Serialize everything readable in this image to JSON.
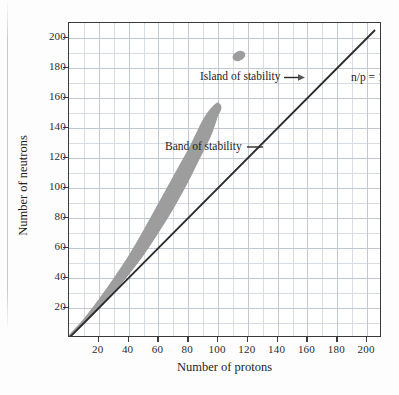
{
  "chart_data": {
    "type": "area",
    "title": "",
    "xlabel": "Number of protons",
    "ylabel": "Number of neutrons",
    "xlim": [
      0,
      210
    ],
    "ylim": [
      0,
      210
    ],
    "xticks": [
      20,
      40,
      60,
      80,
      100,
      120,
      140,
      160,
      180,
      200
    ],
    "yticks": [
      20,
      40,
      60,
      80,
      100,
      120,
      140,
      160,
      180,
      200
    ],
    "grid": true,
    "minor_grid_step": 10,
    "legend": "none",
    "annotations": [
      {
        "label": "Island of stability",
        "pointer": "arrow-right",
        "target_x": 104,
        "target_y": 188
      },
      {
        "label": "Band of stability",
        "pointer": "dash-right",
        "target_x": 88,
        "target_y": 146
      },
      {
        "label": "n/p = 1",
        "pointer": "none",
        "target_x": 178,
        "target_y": 182
      }
    ],
    "series": [
      {
        "name": "n/p = 1",
        "type": "line",
        "color": "#2b2b2b",
        "x": [
          0,
          205
        ],
        "y": [
          0,
          205
        ]
      },
      {
        "name": "Band of stability",
        "type": "area",
        "color": "#9d9d9d",
        "upper_x": [
          0,
          10,
          20,
          30,
          40,
          50,
          60,
          70,
          80,
          85,
          90,
          95,
          98,
          100,
          102
        ],
        "upper_y": [
          2,
          13,
          26,
          40,
          55,
          72,
          90,
          108,
          126,
          136,
          146,
          153,
          156,
          157,
          155
        ],
        "lower_x": [
          0,
          10,
          20,
          30,
          40,
          50,
          60,
          70,
          80,
          85,
          90,
          95,
          98,
          100,
          102
        ],
        "lower_y": [
          0,
          9,
          19,
          30,
          42,
          55,
          70,
          86,
          104,
          114,
          124,
          134,
          142,
          148,
          152
        ]
      },
      {
        "name": "Island of stability",
        "type": "blob",
        "color": "#9d9d9d",
        "center_x": 114,
        "center_y": 188,
        "radius_x": 4.5,
        "radius_y": 3.2
      }
    ]
  },
  "axes": {
    "x_title": "Number of protons",
    "y_title": "Number of neutrons",
    "x_tick_labels": [
      "20",
      "40",
      "60",
      "80",
      "100",
      "120",
      "140",
      "160",
      "180",
      "200"
    ],
    "y_tick_labels": [
      "20",
      "40",
      "60",
      "80",
      "100",
      "120",
      "140",
      "160",
      "180",
      "200"
    ]
  },
  "labels": {
    "island_of_stability": "Island of stability",
    "band_of_stability": "Band of stability",
    "np_ratio": "n/p = 1"
  },
  "colors": {
    "band_gray": "#9d9d9d",
    "line_black": "#2b2b2b",
    "grid": "#d8dde4",
    "frame": "#3a3a3a",
    "background": "#ffffff"
  }
}
